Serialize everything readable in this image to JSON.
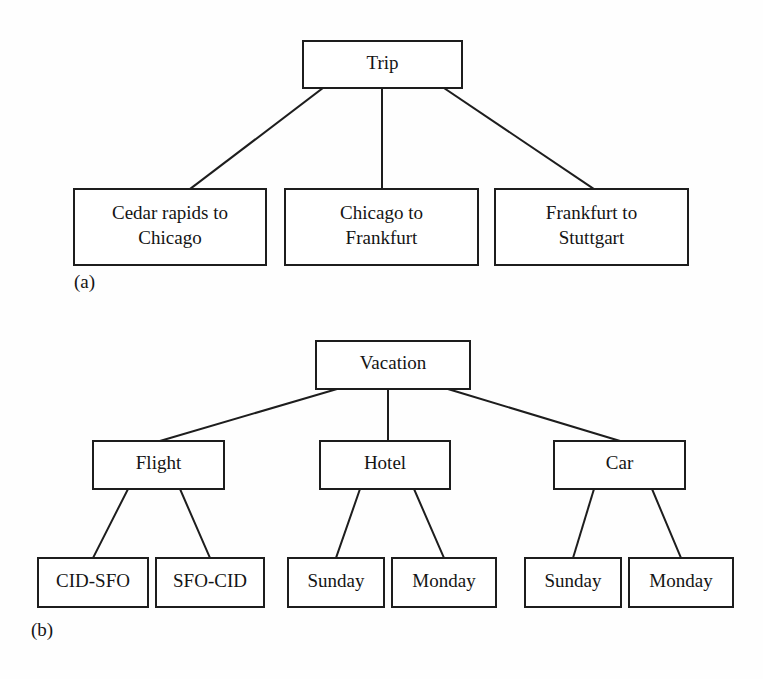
{
  "figure": {
    "kind": "hierarchy-diagram",
    "background_color": "#fefefe",
    "line_color": "#1d1d1d",
    "text_color": "#141414",
    "box_fill": "#ffffff"
  },
  "panels": [
    {
      "id": "panel-a",
      "caption": "(a)",
      "caption_x": 74,
      "caption_y": 288,
      "root": {
        "id": "trip",
        "label": "Trip",
        "lines": [
          "Trip"
        ],
        "x": 303,
        "y": 41,
        "w": 159,
        "h": 47
      },
      "children": [
        {
          "id": "cedar-rapids-to-chicago",
          "label": "Cedar rapids to Chicago",
          "lines": [
            "Cedar rapids to",
            "Chicago"
          ],
          "x": 74,
          "y": 189,
          "w": 192,
          "h": 76
        },
        {
          "id": "chicago-to-frankfurt",
          "label": "Chicago to Frankfurt",
          "lines": [
            "Chicago to",
            "Frankfurt"
          ],
          "x": 285,
          "y": 189,
          "w": 193,
          "h": 76
        },
        {
          "id": "frankfurt-to-stuttgart",
          "label": "Frankfurt to Stuttgart",
          "lines": [
            "Frankfurt to",
            "Stuttgart"
          ],
          "x": 495,
          "y": 189,
          "w": 193,
          "h": 76
        }
      ],
      "edges": [
        {
          "from": "trip",
          "to": "cedar-rapids-to-chicago",
          "x1": 323,
          "y1": 88,
          "x2": 190,
          "y2": 189
        },
        {
          "from": "trip",
          "to": "chicago-to-frankfurt",
          "x1": 382,
          "y1": 88,
          "x2": 382,
          "y2": 189
        },
        {
          "from": "trip",
          "to": "frankfurt-to-stuttgart",
          "x1": 444,
          "y1": 88,
          "x2": 594,
          "y2": 189
        }
      ]
    },
    {
      "id": "panel-b",
      "caption": "(b)",
      "caption_x": 31,
      "caption_y": 636,
      "root": {
        "id": "vacation",
        "label": "Vacation",
        "lines": [
          "Vacation"
        ],
        "x": 316,
        "y": 341,
        "w": 154,
        "h": 48
      },
      "children": [
        {
          "id": "flight",
          "label": "Flight",
          "lines": [
            "Flight"
          ],
          "x": 93,
          "y": 441,
          "w": 131,
          "h": 48
        },
        {
          "id": "hotel",
          "label": "Hotel",
          "lines": [
            "Hotel"
          ],
          "x": 320,
          "y": 441,
          "w": 130,
          "h": 48
        },
        {
          "id": "car",
          "label": "Car",
          "lines": [
            "Car"
          ],
          "x": 554,
          "y": 441,
          "w": 131,
          "h": 48
        }
      ],
      "grandchildren": [
        {
          "id": "cid-sfo",
          "parent": "flight",
          "label": "CID-SFO",
          "lines": [
            "CID-SFO"
          ],
          "x": 38,
          "y": 558,
          "w": 110,
          "h": 49
        },
        {
          "id": "sfo-cid",
          "parent": "flight",
          "label": "SFO-CID",
          "lines": [
            "SFO-CID"
          ],
          "x": 156,
          "y": 558,
          "w": 108,
          "h": 49
        },
        {
          "id": "hotel-sunday",
          "parent": "hotel",
          "label": "Sunday",
          "lines": [
            "Sunday"
          ],
          "x": 288,
          "y": 558,
          "w": 96,
          "h": 49
        },
        {
          "id": "hotel-monday",
          "parent": "hotel",
          "label": "Monday",
          "lines": [
            "Monday"
          ],
          "x": 392,
          "y": 558,
          "w": 104,
          "h": 49
        },
        {
          "id": "car-sunday",
          "parent": "car",
          "label": "Sunday",
          "lines": [
            "Sunday"
          ],
          "x": 525,
          "y": 558,
          "w": 96,
          "h": 49
        },
        {
          "id": "car-monday",
          "parent": "car",
          "label": "Monday",
          "lines": [
            "Monday"
          ],
          "x": 629,
          "y": 558,
          "w": 104,
          "h": 49
        }
      ],
      "edges": [
        {
          "from": "vacation",
          "to": "flight",
          "x1": 337,
          "y1": 389,
          "x2": 160,
          "y2": 441
        },
        {
          "from": "vacation",
          "to": "hotel",
          "x1": 388,
          "y1": 389,
          "x2": 388,
          "y2": 441
        },
        {
          "from": "vacation",
          "to": "car",
          "x1": 448,
          "y1": 389,
          "x2": 620,
          "y2": 441
        },
        {
          "from": "flight",
          "to": "cid-sfo",
          "x1": 128,
          "y1": 489,
          "x2": 93,
          "y2": 558
        },
        {
          "from": "flight",
          "to": "sfo-cid",
          "x1": 180,
          "y1": 489,
          "x2": 210,
          "y2": 558
        },
        {
          "from": "hotel",
          "to": "hotel-sunday",
          "x1": 360,
          "y1": 489,
          "x2": 336,
          "y2": 558
        },
        {
          "from": "hotel",
          "to": "hotel-monday",
          "x1": 414,
          "y1": 489,
          "x2": 444,
          "y2": 558
        },
        {
          "from": "car",
          "to": "car-sunday",
          "x1": 594,
          "y1": 489,
          "x2": 573,
          "y2": 558
        },
        {
          "from": "car",
          "to": "car-monday",
          "x1": 652,
          "y1": 489,
          "x2": 681,
          "y2": 558
        }
      ]
    }
  ]
}
